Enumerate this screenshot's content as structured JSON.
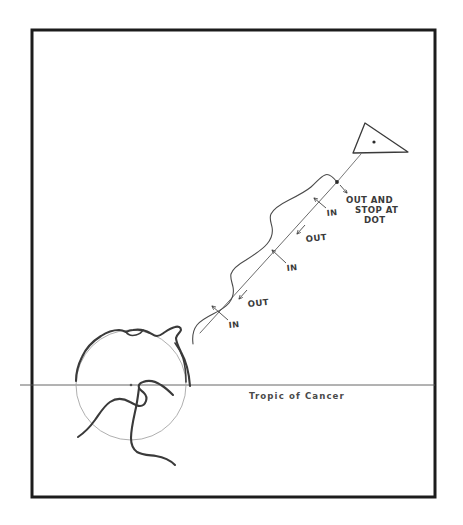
{
  "figure": {
    "medium": "hand-drawn pencil sketch",
    "frame": {
      "name": "border-frame",
      "x": 32,
      "y": 30,
      "width": 403,
      "height": 467,
      "stroke_color": "#1c1c1c",
      "stroke_width": 3
    },
    "background_color": "#ffffff",
    "ink_color": "#3a3a3a",
    "faint_ink_color": "#9a9a9a"
  },
  "earth": {
    "name": "earth-globe",
    "center_x": 131,
    "center_y": 385,
    "radius": 55,
    "center_dot": true,
    "circle_stroke_color": "#a0a0a0",
    "coastline_stroke_color": "#3a3a3a"
  },
  "tropic_line": {
    "name": "tropic-of-cancer-line",
    "label": "Tropic of Cancer",
    "y": 385,
    "x_start": 20,
    "x_end": 435,
    "label_x": 250,
    "label_y": 398,
    "stroke_color": "#555555"
  },
  "target": {
    "name": "target-triangle",
    "points": "365,123 408,152 353,153",
    "dot_x": 374,
    "dot_y": 142,
    "stroke_color": "#3a3a3a"
  },
  "terminal_dot": {
    "name": "terminal-dot",
    "x": 337,
    "y": 182
  },
  "connector": {
    "name": "target-connector-line",
    "from_x": 337,
    "from_y": 182,
    "to_x": 360,
    "to_y": 154
  },
  "trajectory": {
    "name": "oscillating-trajectory",
    "description": "wavy curve weaving in and out across a straight reference line",
    "straight_path_name": "straight-reference-path",
    "wavy_path_name": "wavy-oscillating-path",
    "start_x": 196,
    "start_y": 338,
    "end_x": 337,
    "end_y": 182
  },
  "annotations": [
    {
      "name": "annotation-in-1",
      "text": "IN",
      "x": 232,
      "y": 325,
      "arrow_from_x": 228,
      "arrow_from_y": 320,
      "arrow_to_x": 212,
      "arrow_to_y": 307
    },
    {
      "name": "annotation-out-1",
      "text": "OUT",
      "x": 253,
      "y": 303,
      "arrow_from_x": 249,
      "arrow_from_y": 293,
      "arrow_to_x": 240,
      "arrow_to_y": 300
    },
    {
      "name": "annotation-in-2",
      "text": "IN",
      "x": 290,
      "y": 268,
      "arrow_from_x": 286,
      "arrow_from_y": 263,
      "arrow_to_x": 272,
      "arrow_to_y": 251
    },
    {
      "name": "annotation-out-2",
      "text": "OUT",
      "x": 311,
      "y": 238,
      "arrow_from_x": 307,
      "arrow_from_y": 228,
      "arrow_to_x": 299,
      "arrow_to_y": 235
    },
    {
      "name": "annotation-in-3",
      "text": "IN",
      "x": 330,
      "y": 213,
      "arrow_from_x": 326,
      "arrow_from_y": 208,
      "arrow_to_x": 315,
      "arrow_to_y": 199
    },
    {
      "name": "annotation-out-stop",
      "text_lines": [
        "OUT AND",
        "STOP AT",
        "DOT"
      ],
      "x": 348,
      "y": 200,
      "arrow_from_x": 341,
      "arrow_from_y": 186,
      "arrow_to_x": 348,
      "arrow_to_y": 194
    }
  ]
}
